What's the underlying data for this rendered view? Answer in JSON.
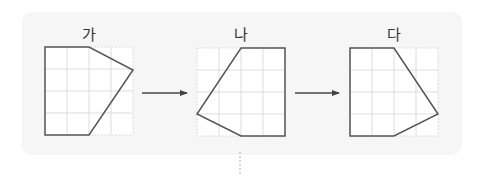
{
  "diagram": {
    "colors": {
      "panel_background": "#f6f6f6",
      "grid_line": "#d4d4d4",
      "shape_stroke": "#555555",
      "shape_fill": "#ffffff",
      "arrow": "#444444",
      "divider": "#aaaaaa"
    },
    "figures": [
      {
        "label": "가",
        "grid": {
          "x": 45,
          "y": 47,
          "cols": 4,
          "rows": 4,
          "cell": 22
        },
        "points": "45,47 89,47 133,70 89,135 45,135"
      },
      {
        "label": "나",
        "grid": {
          "x": 197,
          "y": 48,
          "cols": 4,
          "rows": 4,
          "cell": 22
        },
        "points": "241,48 285,48 285,136 241,136 197,114"
      },
      {
        "label": "다",
        "grid": {
          "x": 350,
          "y": 48,
          "cols": 4,
          "rows": 4,
          "cell": 22
        },
        "points": "350,48 394,48 438,114 394,136 350,136"
      }
    ],
    "arrows": [
      {
        "x1": 142,
        "x2": 188,
        "y": 93
      },
      {
        "x1": 295,
        "x2": 340,
        "y": 93
      }
    ]
  }
}
